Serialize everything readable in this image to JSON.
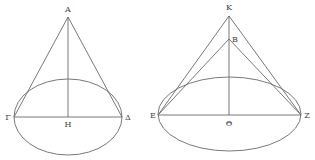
{
  "figure": {
    "type": "geometric-diagram",
    "line_color": "#6a6a6a",
    "label_color": "#444444"
  },
  "left_cone": {
    "labels": {
      "apex": "A",
      "left": "Γ",
      "center": "H",
      "right": "Δ"
    },
    "apex": [
      68,
      17
    ],
    "base_center": [
      68,
      117
    ],
    "base_rx": 54,
    "base_ry": 38,
    "diameter_left": [
      14,
      117
    ],
    "diameter_right": [
      122,
      117
    ]
  },
  "right_cone": {
    "labels": {
      "apex_outer": "K",
      "apex_inner": "B",
      "left": "E",
      "center": "Θ",
      "right": "Z"
    },
    "apex_outer": [
      229,
      16
    ],
    "apex_inner": [
      229,
      39
    ],
    "base_center": [
      229.5,
      114
    ],
    "base_rx": 71.5,
    "base_ry": 37,
    "diameter_left": [
      158,
      115
    ],
    "diameter_right": [
      301,
      115
    ]
  }
}
